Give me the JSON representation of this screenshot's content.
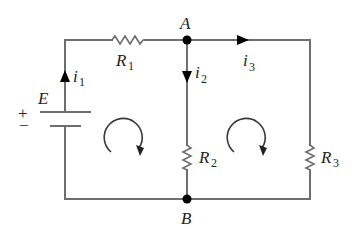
{
  "diagram": {
    "type": "circuit",
    "colors": {
      "wire": "#6e6e6e",
      "node": "#000000",
      "text": "#222222"
    },
    "source": {
      "label": "E",
      "plus": "+",
      "minus": "−"
    },
    "resistors": [
      {
        "id": "R1",
        "base": "R",
        "sub": "1"
      },
      {
        "id": "R2",
        "base": "R",
        "sub": "2"
      },
      {
        "id": "R3",
        "base": "R",
        "sub": "3"
      }
    ],
    "currents": [
      {
        "id": "i1",
        "base": "i",
        "sub": "1",
        "direction": "up"
      },
      {
        "id": "i2",
        "base": "i",
        "sub": "2",
        "direction": "down"
      },
      {
        "id": "i3",
        "base": "i",
        "sub": "3",
        "direction": "right"
      }
    ],
    "nodes": [
      {
        "id": "A",
        "label": "A"
      },
      {
        "id": "B",
        "label": "B"
      }
    ],
    "loops": [
      {
        "id": "loop-left",
        "direction": "clockwise"
      },
      {
        "id": "loop-right",
        "direction": "clockwise"
      }
    ]
  }
}
